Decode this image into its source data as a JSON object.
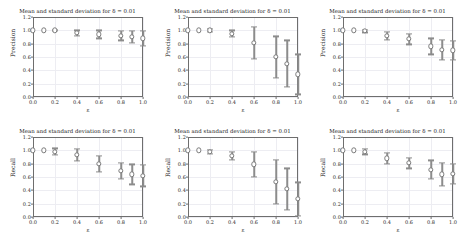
{
  "figure": {
    "width": 466,
    "height": 241,
    "background": "#ffffff",
    "grid_color": "#ededf2",
    "marker_color": "#7a7a7a",
    "errorbar_color": "#8c8c8c",
    "panel_rows": 2,
    "panel_cols": 3
  },
  "chart_data": [
    {
      "type": "scatter",
      "panel_id": "precision-panel-1",
      "position": "top-left",
      "title": "Mean and standard deviation for δ = 0.01",
      "xlabel": "ε",
      "ylabel": "Precision",
      "xlim": [
        0.0,
        1.0
      ],
      "ylim": [
        0.0,
        1.2
      ],
      "xticks": [
        0.0,
        0.2,
        0.4,
        0.6,
        0.8,
        1.0
      ],
      "xtick_labels": [
        "0.0",
        "0.2",
        "0.4",
        "0.6",
        "0.8",
        "1.0"
      ],
      "yticks": [
        0.0,
        0.2,
        0.4,
        0.6,
        0.8,
        1.0,
        1.2
      ],
      "ytick_labels": [
        "0.0",
        "0.2",
        "0.4",
        "0.6",
        "0.8",
        "1.0",
        "1.2"
      ],
      "grid": true,
      "legend": "none",
      "x": [
        0.0,
        0.1,
        0.2,
        0.4,
        0.6,
        0.8,
        0.9,
        1.0
      ],
      "y": [
        1.0,
        1.0,
        1.0,
        0.96,
        0.94,
        0.92,
        0.9,
        0.88
      ],
      "yerr": [
        0.0,
        0.0,
        0.01,
        0.04,
        0.06,
        0.07,
        0.09,
        0.11
      ]
    },
    {
      "type": "scatter",
      "panel_id": "precision-panel-2",
      "position": "top-center",
      "title": "Mean and standard deviation for δ = 0.01",
      "xlabel": "ε",
      "ylabel": "Precision",
      "xlim": [
        0.0,
        1.0
      ],
      "ylim": [
        0.0,
        1.2
      ],
      "xticks": [
        0.0,
        0.2,
        0.4,
        0.6,
        0.8,
        1.0
      ],
      "xtick_labels": [
        "0.0",
        "0.2",
        "0.4",
        "0.6",
        "0.8",
        "1.0"
      ],
      "yticks": [
        0.0,
        0.2,
        0.4,
        0.6,
        0.8,
        1.0,
        1.2
      ],
      "ytick_labels": [
        "0.0",
        "0.2",
        "0.4",
        "0.6",
        "0.8",
        "1.0",
        "1.2"
      ],
      "grid": true,
      "legend": "none",
      "x": [
        0.0,
        0.1,
        0.2,
        0.4,
        0.6,
        0.8,
        0.9,
        1.0
      ],
      "y": [
        1.0,
        1.0,
        1.0,
        0.95,
        0.81,
        0.6,
        0.5,
        0.34
      ],
      "yerr": [
        0.0,
        0.0,
        0.02,
        0.05,
        0.24,
        0.31,
        0.35,
        0.3
      ]
    },
    {
      "type": "scatter",
      "panel_id": "precision-panel-3",
      "position": "top-right",
      "title": "Mean and standard deviation for δ = 0.01",
      "xlabel": "ε",
      "ylabel": "Precision",
      "xlim": [
        0.0,
        1.0
      ],
      "ylim": [
        0.0,
        1.2
      ],
      "xticks": [
        0.0,
        0.2,
        0.4,
        0.6,
        0.8,
        1.0
      ],
      "xtick_labels": [
        "0.0",
        "0.2",
        "0.4",
        "0.6",
        "0.8",
        "1.0"
      ],
      "yticks": [
        0.0,
        0.2,
        0.4,
        0.6,
        0.8,
        1.0,
        1.2
      ],
      "ytick_labels": [
        "0.0",
        "0.2",
        "0.4",
        "0.6",
        "0.8",
        "1.0",
        "1.2"
      ],
      "grid": true,
      "legend": "none",
      "x": [
        0.0,
        0.1,
        0.2,
        0.4,
        0.6,
        0.8,
        0.9,
        1.0
      ],
      "y": [
        1.0,
        1.0,
        0.99,
        0.92,
        0.87,
        0.76,
        0.71,
        0.7
      ],
      "yerr": [
        0.0,
        0.0,
        0.02,
        0.06,
        0.08,
        0.12,
        0.15,
        0.14
      ]
    },
    {
      "type": "scatter",
      "panel_id": "recall-panel-1",
      "position": "bottom-left",
      "title": "Mean and standard deviation for δ = 0.01",
      "xlabel": "ε",
      "ylabel": "Recall",
      "xlim": [
        0.0,
        1.0
      ],
      "ylim": [
        0.0,
        1.2
      ],
      "xticks": [
        0.0,
        0.2,
        0.4,
        0.6,
        0.8,
        1.0
      ],
      "xtick_labels": [
        "0.0",
        "0.2",
        "0.4",
        "0.6",
        "0.8",
        "1.0"
      ],
      "yticks": [
        0.0,
        0.2,
        0.4,
        0.6,
        0.8,
        1.0,
        1.2
      ],
      "ytick_labels": [
        "0.0",
        "0.2",
        "0.4",
        "0.6",
        "0.8",
        "1.0",
        "1.2"
      ],
      "grid": true,
      "legend": "none",
      "x": [
        0.0,
        0.1,
        0.2,
        0.4,
        0.6,
        0.8,
        0.9,
        1.0
      ],
      "y": [
        1.0,
        1.0,
        0.98,
        0.93,
        0.8,
        0.69,
        0.64,
        0.62
      ],
      "yerr": [
        0.0,
        0.0,
        0.05,
        0.09,
        0.12,
        0.12,
        0.15,
        0.16
      ]
    },
    {
      "type": "scatter",
      "panel_id": "recall-panel-2",
      "position": "bottom-center",
      "title": "Mean and standard deviation for δ = 0.01",
      "xlabel": "ε",
      "ylabel": "Recall",
      "xlim": [
        0.0,
        1.0
      ],
      "ylim": [
        0.0,
        1.2
      ],
      "xticks": [
        0.0,
        0.2,
        0.4,
        0.6,
        0.8,
        1.0
      ],
      "xtick_labels": [
        "0.0",
        "0.2",
        "0.4",
        "0.6",
        "0.8",
        "1.0"
      ],
      "yticks": [
        0.0,
        0.2,
        0.4,
        0.6,
        0.8,
        1.0,
        1.2
      ],
      "ytick_labels": [
        "0.0",
        "0.2",
        "0.4",
        "0.6",
        "0.8",
        "1.0",
        "1.2"
      ],
      "grid": true,
      "legend": "none",
      "x": [
        0.0,
        0.1,
        0.2,
        0.4,
        0.6,
        0.8,
        0.9,
        1.0
      ],
      "y": [
        1.0,
        1.0,
        0.98,
        0.92,
        0.79,
        0.53,
        0.42,
        0.27
      ],
      "yerr": [
        0.0,
        0.0,
        0.03,
        0.06,
        0.19,
        0.33,
        0.31,
        0.25
      ]
    },
    {
      "type": "scatter",
      "panel_id": "recall-panel-3",
      "position": "bottom-right",
      "title": "Mean and standard deviation for δ = 0.01",
      "xlabel": "ε",
      "ylabel": "Recall",
      "xlim": [
        0.0,
        1.0
      ],
      "ylim": [
        0.0,
        1.2
      ],
      "xticks": [
        0.0,
        0.2,
        0.4,
        0.6,
        0.8,
        1.0
      ],
      "xtick_labels": [
        "0.0",
        "0.2",
        "0.4",
        "0.6",
        "0.8",
        "1.0"
      ],
      "yticks": [
        0.0,
        0.2,
        0.4,
        0.6,
        0.8,
        1.0,
        1.2
      ],
      "ytick_labels": [
        "0.0",
        "0.2",
        "0.4",
        "0.6",
        "0.8",
        "1.0",
        "1.2"
      ],
      "grid": true,
      "legend": "none",
      "x": [
        0.0,
        0.1,
        0.2,
        0.4,
        0.6,
        0.8,
        0.9,
        1.0
      ],
      "y": [
        1.0,
        1.0,
        0.98,
        0.88,
        0.81,
        0.71,
        0.64,
        0.65
      ],
      "yerr": [
        0.0,
        0.0,
        0.04,
        0.08,
        0.08,
        0.14,
        0.17,
        0.15
      ]
    }
  ]
}
